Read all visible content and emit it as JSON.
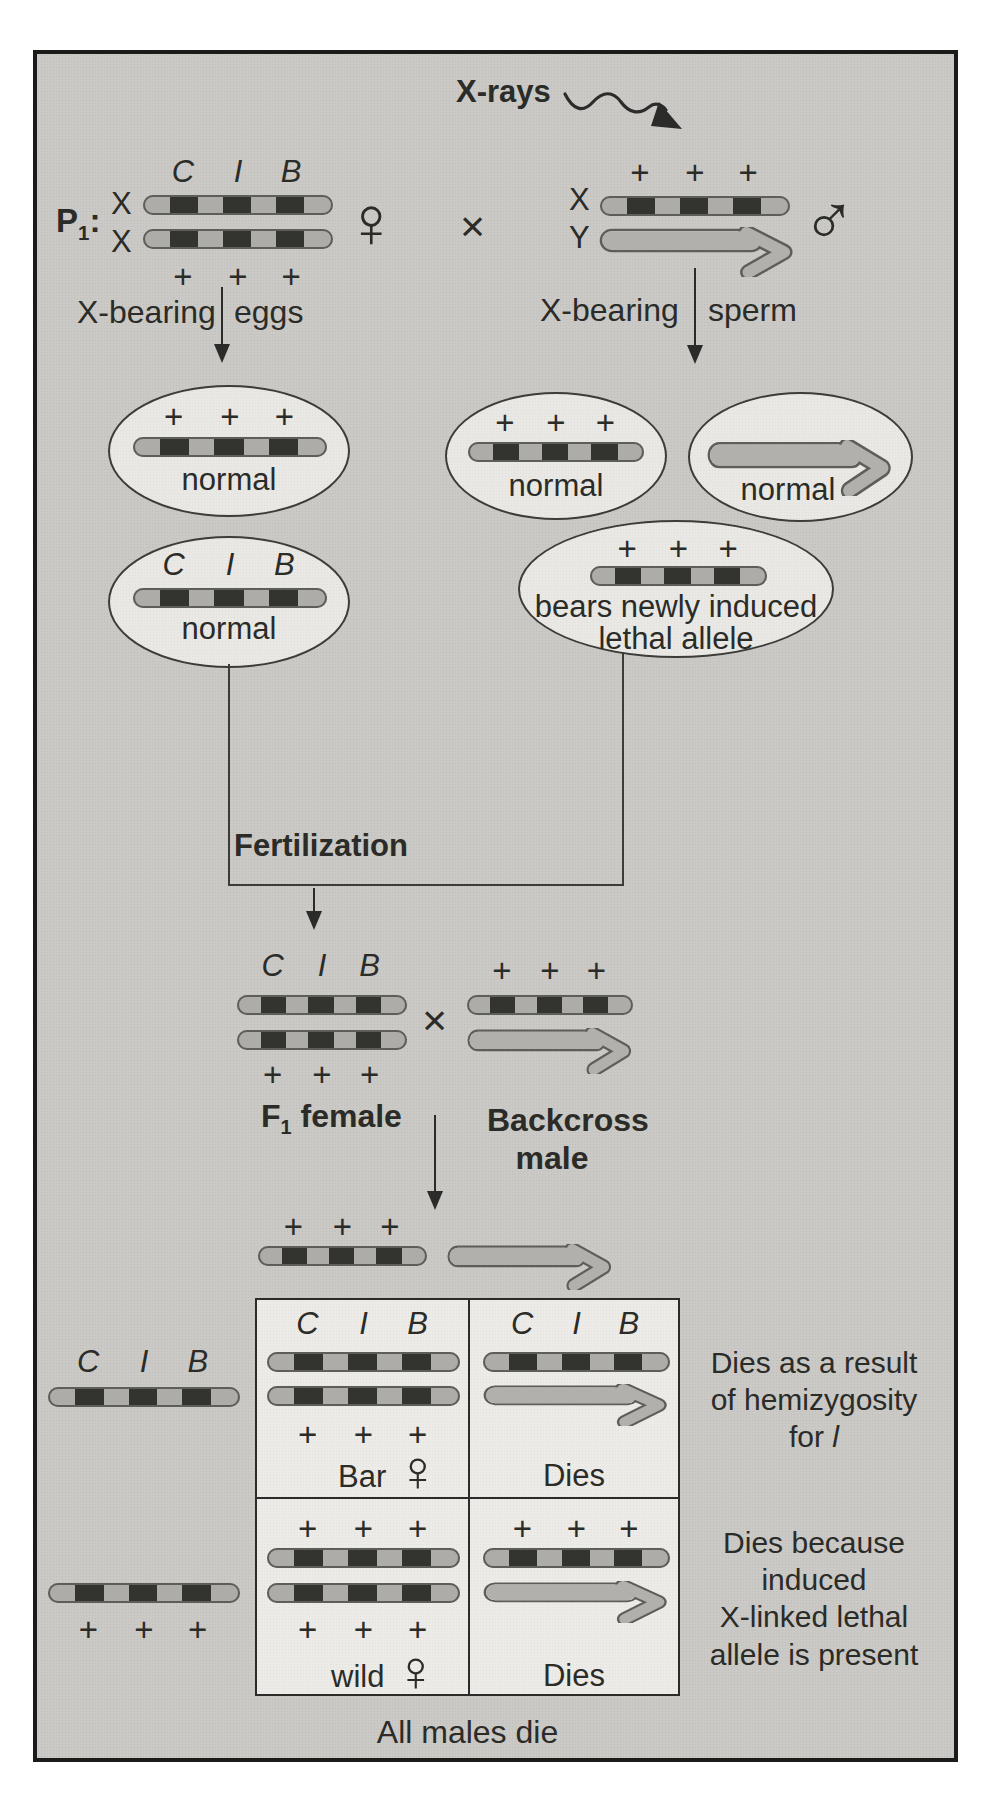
{
  "p1": {
    "label": "P",
    "label_sub": "1",
    "label_suffix": ":",
    "xrays": "X-rays",
    "female": {
      "x_top": "X",
      "x_bottom": "X",
      "genes": [
        "C",
        "I",
        "B"
      ],
      "alleles": [
        "+",
        "+",
        "+"
      ],
      "sex_symbol": "♀"
    },
    "cross": "×",
    "male": {
      "x_label": "X",
      "y_label": "Y",
      "alleles": [
        "+",
        "+",
        "+"
      ],
      "sex_symbol": "♂"
    }
  },
  "flow": {
    "eggs": {
      "bearing": "X-bearing",
      "cell": "eggs"
    },
    "sperm": {
      "bearing": "X-bearing",
      "cell": "sperm"
    }
  },
  "eggs": [
    {
      "alleles": [
        "+",
        "+",
        "+"
      ],
      "caption": "normal"
    },
    {
      "genes": [
        "C",
        "I",
        "B"
      ],
      "caption": "normal"
    }
  ],
  "sperm": [
    {
      "alleles": [
        "+",
        "+",
        "+"
      ],
      "caption": "normal"
    },
    {
      "caption": "normal"
    },
    {
      "alleles": [
        "+",
        "+",
        "+"
      ],
      "caption_l1": "bears newly induced",
      "caption_l2": "lethal allele"
    }
  ],
  "fertilization": "Fertilization",
  "f1": {
    "genes": [
      "C",
      "I",
      "B"
    ],
    "alleles": [
      "+",
      "+",
      "+"
    ],
    "female_label": "F",
    "female_label_sub": "1",
    "female_label_rest": "female",
    "cross": "×",
    "male_alleles": [
      "+",
      "+",
      "+"
    ],
    "male_label_l1": "Backcross",
    "male_label_l2": "male"
  },
  "backcross_gametes": {
    "x_alleles": [
      "+",
      "+",
      "+"
    ]
  },
  "egg_gametes": [
    {
      "genes": [
        "C",
        "I",
        "B"
      ]
    },
    {
      "alleles": [
        "+",
        "+",
        "+"
      ]
    }
  ],
  "punnett": {
    "r1c1": {
      "genes": [
        "C",
        "I",
        "B"
      ],
      "alleles": [
        "+",
        "+",
        "+"
      ],
      "caption": "Bar",
      "sex_symbol": "♀"
    },
    "r1c2": {
      "genes": [
        "C",
        "I",
        "B"
      ],
      "caption": "Dies"
    },
    "r2c1": {
      "alleles_top": [
        "+",
        "+",
        "+"
      ],
      "alleles_bottom": [
        "+",
        "+",
        "+"
      ],
      "caption": "wild",
      "sex_symbol": "♀"
    },
    "r2c2": {
      "alleles": [
        "+",
        "+",
        "+"
      ],
      "caption": "Dies"
    }
  },
  "notes": {
    "hemizygosity": {
      "l1": "Dies as a result",
      "l2": "of hemizygosity",
      "l3": "for",
      "l3_gene": "l"
    },
    "lethal": {
      "l1": "Dies because",
      "l2": "induced",
      "l3": "X-linked lethal",
      "l4": "allele is present"
    }
  },
  "footer": "All males die"
}
